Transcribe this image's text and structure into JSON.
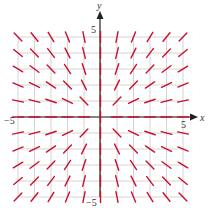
{
  "chart_data": {
    "type": "slope_field",
    "title": "",
    "equation": "dy/dx = y/x",
    "xlabel": "x",
    "ylabel": "y",
    "xlim": [
      -5,
      5
    ],
    "ylim": [
      -5,
      5
    ],
    "grid": true,
    "grid_step": 1,
    "tick_labels": {
      "x_min": "−5",
      "x_max": "5",
      "y_min": "−5",
      "y_max": "5"
    },
    "segment_points": {
      "x": [
        -5,
        -4,
        -3,
        -2,
        -1,
        0,
        1,
        2,
        3,
        4,
        5
      ],
      "y": [
        -5,
        -4,
        -3,
        -2,
        -1,
        0,
        1,
        2,
        3,
        4,
        5
      ]
    }
  },
  "colors": {
    "segment": "#c8102e",
    "grid": "#c9c9c9",
    "axis": "#222222"
  },
  "labels": {
    "x_axis": "x",
    "y_axis": "y",
    "x_min": "−5",
    "x_max": "5",
    "y_min": "−5",
    "y_max": "5"
  }
}
